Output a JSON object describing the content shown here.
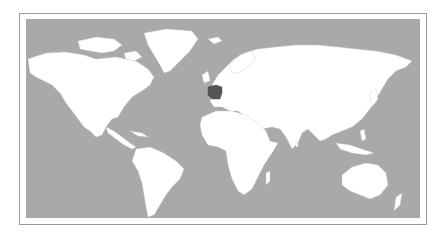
{
  "map": {
    "type": "world-political",
    "highlighted_country": "France",
    "colors": {
      "ocean": "#a9a9a9",
      "land": "#ffffff",
      "borders": "#c8c8c8",
      "highlight": "#555555",
      "frame": "#9a9a9a"
    }
  }
}
